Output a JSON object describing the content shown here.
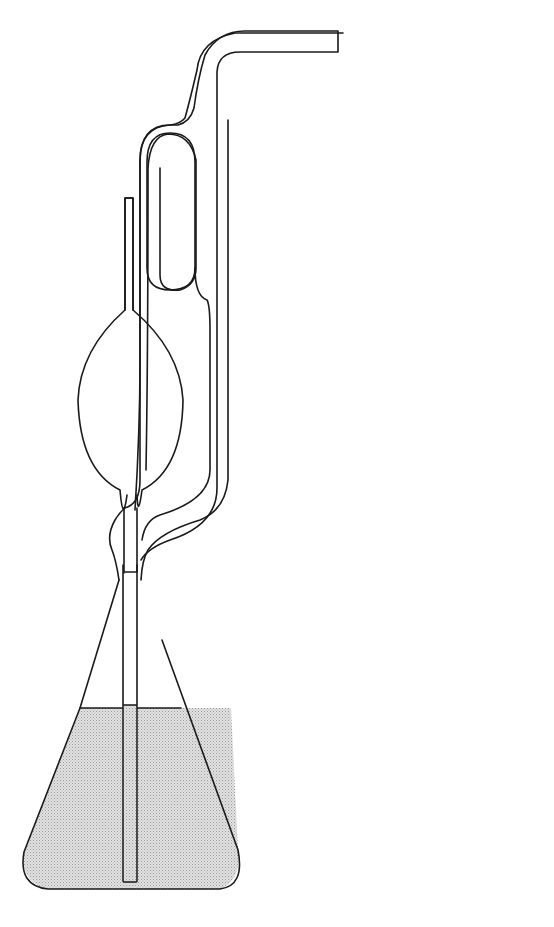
{
  "figure": {
    "panel_a": {
      "caption": "(a)",
      "labels": {
        "M": "M",
        "M_prime": "M′",
        "A": "A",
        "B": "B",
        "C": "C",
        "V": "V",
        "L": "L",
        "L_prime": "L′",
        "D": "D"
      },
      "annotations": {
        "to_vacuum": "To vacuum",
        "air_bleed": "Air bleed",
        "auxiliary_vacuum": "Auxiliary vacuum"
      }
    },
    "panel_b": {
      "caption": "(b)",
      "labels": {
        "h": "h",
        "a_left": "a",
        "a_right": "a",
        "A": "A",
        "B": "B"
      }
    },
    "colors": {
      "line": "#1a1a1a",
      "liquid": "#d9d9d9",
      "background": "#ffffff"
    }
  }
}
